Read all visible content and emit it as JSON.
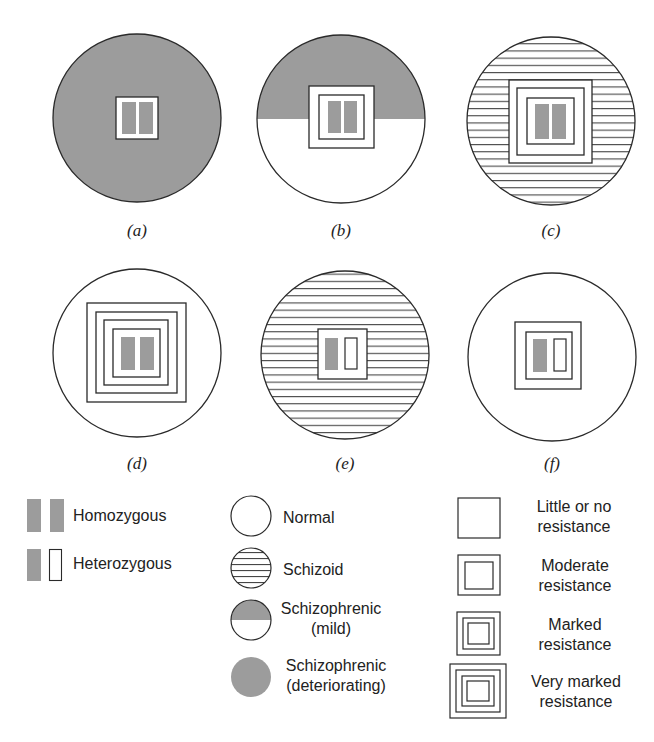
{
  "figure": {
    "colors": {
      "stroke": "#2a2a2a",
      "shade": "#9c9c9c",
      "background": "#ffffff"
    },
    "panels": [
      {
        "id": "a",
        "label": "(a)",
        "phenotype": "Schizophrenic (deteriorating)",
        "genotype": "Homozygous",
        "resistance": "Little or no resistance"
      },
      {
        "id": "b",
        "label": "(b)",
        "phenotype": "Schizophrenic (mild)",
        "genotype": "Homozygous",
        "resistance": "Moderate resistance"
      },
      {
        "id": "c",
        "label": "(c)",
        "phenotype": "Schizoid",
        "genotype": "Homozygous",
        "resistance": "Marked resistance"
      },
      {
        "id": "d",
        "label": "(d)",
        "phenotype": "Normal",
        "genotype": "Homozygous",
        "resistance": "Very marked resistance"
      },
      {
        "id": "e",
        "label": "(e)",
        "phenotype": "Schizoid",
        "genotype": "Heterozygous",
        "resistance": "Little or no resistance"
      },
      {
        "id": "f",
        "label": "(f)",
        "phenotype": "Normal",
        "genotype": "Heterozygous",
        "resistance": "Moderate resistance"
      }
    ]
  },
  "legend": {
    "genotype": [
      {
        "label": "Homozygous",
        "icon": "homozygous-icon"
      },
      {
        "label": "Heterozygous",
        "icon": "heterozygous-icon"
      }
    ],
    "phenotype": [
      {
        "label": "Normal",
        "icon": "normal-circle-icon"
      },
      {
        "label": "Schizoid",
        "icon": "schizoid-circle-icon"
      },
      {
        "line1": "Schizophrenic",
        "line2": "(mild)",
        "icon": "schizophrenic-mild-circle-icon"
      },
      {
        "line1": "Schizophrenic",
        "line2": "(deteriorating)",
        "icon": "schizophrenic-deteriorating-circle-icon"
      }
    ],
    "resistance": [
      {
        "line1": "Little or no",
        "line2": "resistance",
        "icon": "single-square-icon"
      },
      {
        "line1": "Moderate",
        "line2": "resistance",
        "icon": "double-square-icon"
      },
      {
        "line1": "Marked",
        "line2": "resistance",
        "icon": "triple-square-icon"
      },
      {
        "line1": "Very marked",
        "line2": "resistance",
        "icon": "quadruple-square-icon"
      }
    ]
  }
}
